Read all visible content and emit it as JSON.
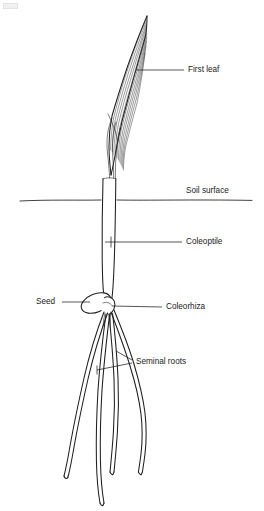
{
  "figure": {
    "background_color": "#ffffff",
    "ink_color": "#1f1f1f",
    "width": 264,
    "height": 511
  },
  "labels": {
    "first_leaf": "First leaf",
    "soil_surface": "Soil surface",
    "coleoptile": "Coleoptile",
    "seed": "Seed",
    "coleorhiza": "Coleorhiza",
    "seminal_roots": "Seminal roots"
  },
  "parts": [
    {
      "id": "first-leaf",
      "label": "First leaf",
      "label_x": 188,
      "label_y": 70,
      "leader": "M 136 70 L 184 70",
      "pointer_from": [
        136,
        70
      ],
      "region": "above-soil"
    },
    {
      "id": "soil-surface",
      "label": "Soil surface",
      "label_x": 186,
      "label_y": 191,
      "leader": "",
      "pointer_from": null,
      "region": "boundary"
    },
    {
      "id": "coleoptile",
      "label": "Coleoptile",
      "label_x": 186,
      "label_y": 242,
      "leader": "M 111 242 L 182 242",
      "pointer_from": [
        111,
        242
      ],
      "region": "both"
    },
    {
      "id": "seed",
      "label": "Seed",
      "label_x": 36,
      "label_y": 302,
      "leader": "M 62 302 L 92 302",
      "pointer_from": [
        92,
        302
      ],
      "region": "below-soil"
    },
    {
      "id": "coleorhiza",
      "label": "Coleorhiza",
      "label_x": 166,
      "label_y": 307,
      "leader": "M 113 306 L 162 307",
      "pointer_from": [
        113,
        306
      ],
      "region": "below-soil"
    },
    {
      "id": "seminal-roots",
      "label": "Seminal roots",
      "label_x": 136,
      "label_y": 362,
      "leader": "M 98 370 L 132 362 M 118 352 L 132 362",
      "pointer_from": [
        98,
        370
      ],
      "region": "below-soil"
    }
  ],
  "geometry": {
    "soil_line_y": 200,
    "soil_line_x_start": 20,
    "soil_line_x_end": 252,
    "coleoptile_top_y": 178,
    "coleoptile_left_x": 102,
    "coleoptile_right_x": 116,
    "seed_center": [
      96,
      303
    ],
    "seed_rx": 15,
    "seed_ry": 9,
    "seed_rotation_deg": -22,
    "leaf_tip": [
      147,
      16
    ],
    "root_count": 4,
    "vein_count": 11
  }
}
